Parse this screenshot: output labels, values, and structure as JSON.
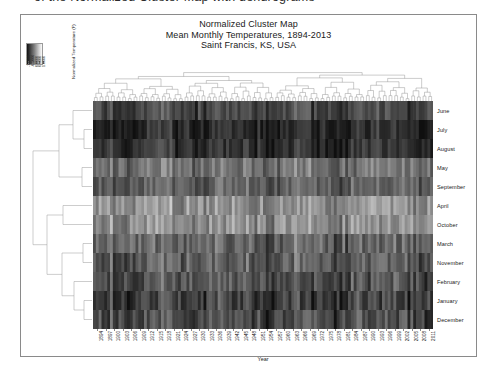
{
  "document": {
    "clipped_line_above": "of the Normalized Cluster Map with dendrograms"
  },
  "figure": {
    "title_lines": [
      "Normalized Cluster Map",
      "Mean Monthly Temperatures, 1894-2013",
      "Saint Francis, KS, USA"
    ],
    "colorbar": {
      "axis_title": "Normalized Temperature (F)",
      "tick_labels": [
        "-1.0000",
        "-0.5000",
        "0.0000",
        "0.5000",
        "1.0000"
      ],
      "colormap": "grayscale",
      "low_color": "#111111",
      "high_color": "#ffffff"
    }
  },
  "chart_data": {
    "type": "heatmap",
    "xlabel": "Year",
    "ylabel": "",
    "colorbar_label": "Normalized Temperature (F)",
    "grid": false,
    "legend_position": "top-left",
    "zlim": [
      -1.0,
      1.0
    ],
    "row_order_clustered": [
      "June",
      "July",
      "August",
      "May",
      "September",
      "April",
      "October",
      "March",
      "November",
      "February",
      "January",
      "December"
    ],
    "row_cluster_groups": [
      {
        "name": "warm-season",
        "members": [
          "June",
          "July",
          "August",
          "May",
          "September"
        ]
      },
      {
        "name": "shoulder-season",
        "members": [
          "April",
          "October"
        ]
      },
      {
        "name": "cool-season",
        "members": [
          "March",
          "November",
          "February",
          "January",
          "December"
        ]
      }
    ],
    "row_mean_normalized": {
      "June": 0.52,
      "July": 0.78,
      "August": 0.71,
      "May": 0.18,
      "September": 0.3,
      "April": -0.12,
      "October": -0.1,
      "March": 0.28,
      "November": 0.34,
      "February": 0.42,
      "January": 0.58,
      "December": 0.5
    },
    "x_tick_labels": [
      "1894",
      "1897",
      "1900",
      "1903",
      "1906",
      "1909",
      "1912",
      "1915",
      "1918",
      "1921",
      "1924",
      "1927",
      "1930",
      "1933",
      "1936",
      "1939",
      "1942",
      "1945",
      "1948",
      "1951",
      "1954",
      "1957",
      "1960",
      "1963",
      "1966",
      "1969",
      "1972",
      "1975",
      "1978",
      "1981",
      "1984",
      "1987",
      "1990",
      "1993",
      "1996",
      "1999",
      "2002",
      "2005",
      "2008",
      "2011"
    ],
    "x_range": [
      1894,
      2013
    ],
    "n_columns": 120,
    "n_rows": 12,
    "dendrograms": {
      "columns": true,
      "rows": true
    },
    "column_dendrogram_note": "Years clustered and reordered; dense leaf structure across 120 columns",
    "row_dendrogram_note": "Months clustered into warm, shoulder and cool season groups"
  }
}
